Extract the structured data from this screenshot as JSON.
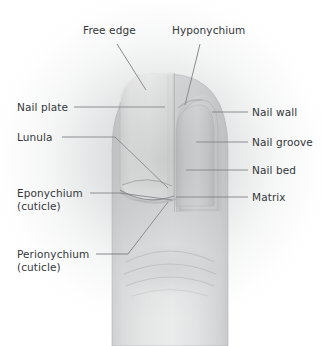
{
  "figure": {
    "view": "dorsal fingertip, half nail-plate cutaway",
    "background_color": "#ffffff",
    "vignette_color": "#aaacae",
    "text_color": "#34373a",
    "leader_line_color": "#4a4d50",
    "nail_plate_color": "#f2f2f0",
    "nail_bed_color": "#c9cacb",
    "skin_color": "#d2d3d4"
  },
  "labels": {
    "free_edge": {
      "text": "Free edge",
      "x": 83,
      "y": 24,
      "side": "top"
    },
    "hyponychium": {
      "text": "Hyponychium",
      "x": 172,
      "y": 24,
      "side": "top"
    },
    "nail_plate": {
      "text": "Nail plate",
      "x": 17,
      "y": 101,
      "side": "left"
    },
    "lunula": {
      "text": "Lunula",
      "x": 17,
      "y": 131,
      "side": "left"
    },
    "eponychium": {
      "text": "Eponychium",
      "sub": "(cuticle)",
      "x": 17,
      "y": 187,
      "side": "left"
    },
    "perionychium": {
      "text": "Perionychium",
      "sub": "(cuticle)",
      "x": 17,
      "y": 248,
      "side": "left"
    },
    "nail_wall": {
      "text": "Nail wall",
      "x": 252,
      "y": 106,
      "side": "right"
    },
    "nail_groove": {
      "text": "Nail groove",
      "x": 252,
      "y": 136,
      "side": "right"
    },
    "nail_bed": {
      "text": "Nail bed",
      "x": 252,
      "y": 164,
      "side": "right"
    },
    "matrix": {
      "text": "Matrix",
      "x": 252,
      "y": 191,
      "side": "right"
    }
  },
  "leader_lines": {
    "free_edge": "M 117,44 L 146,90",
    "hyponychium": "M 200,44 L 185,105",
    "nail_plate": "M 74,107 L 165,107",
    "lunula": "M 62,137 L 115,137 L 168,188",
    "eponychium": "M 90,193 L 120,193",
    "eponychium_tail": "M 120,193 L 172,200",
    "perionychium": "M 96,254 L 128,254 L 168,202",
    "nail_wall": "M 212,112 L 248,112",
    "nail_groove": "M 196,142 L 248,142",
    "nail_bed": "M 186,170 L 248,170",
    "matrix": "M 176,197 L 248,197"
  },
  "anatomy_parts": [
    "Free edge",
    "Hyponychium",
    "Nail plate",
    "Lunula",
    "Eponychium (cuticle)",
    "Perionychium (cuticle)",
    "Nail wall",
    "Nail groove",
    "Nail bed",
    "Matrix"
  ]
}
